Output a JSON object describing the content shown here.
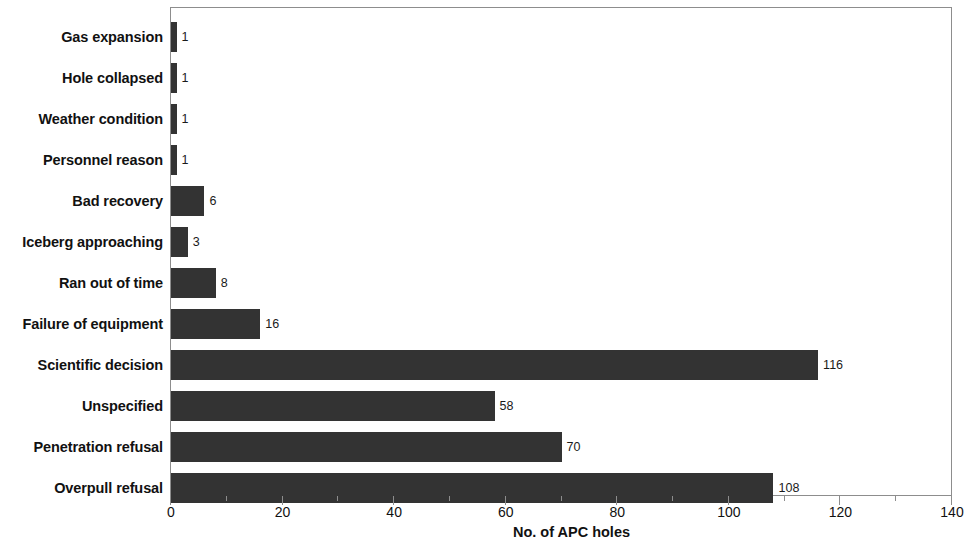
{
  "chart_data": {
    "type": "bar",
    "orientation": "horizontal",
    "title": "",
    "xlabel": "No. of APC holes",
    "ylabel": "",
    "xlim": [
      0,
      140
    ],
    "xticks": [
      0,
      20,
      40,
      60,
      80,
      100,
      120,
      140
    ],
    "xtick_labels": [
      "0",
      "20",
      "40",
      "60",
      "80",
      "100",
      "120",
      "140"
    ],
    "minor_tick_step": 10,
    "grid": false,
    "legend": null,
    "bar_color": "#333333",
    "frame_color": "#8d8d8d",
    "categories": [
      "Gas expansion",
      "Hole collapsed",
      "Weather condition",
      "Personnel reason",
      "Bad recovery",
      "Iceberg approaching",
      "Ran out of time",
      "Failure of equipment",
      "Scientific decision",
      "Unspecified",
      "Penetration refusal",
      "Overpull refusal"
    ],
    "values": [
      1,
      1,
      1,
      1,
      6,
      3,
      8,
      16,
      116,
      58,
      70,
      108
    ],
    "value_labels": [
      "1",
      "1",
      "1",
      "1",
      "6",
      "3",
      "8",
      "16",
      "116",
      "58",
      "70",
      "108"
    ]
  }
}
